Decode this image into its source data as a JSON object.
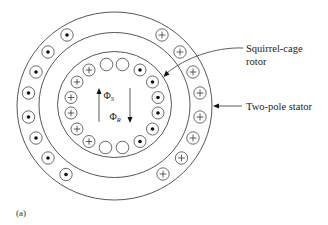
{
  "diagram": {
    "type": "induction-motor-cross-section",
    "caption": "(a)",
    "labels": {
      "rotor": [
        "Squirrel-cage",
        "rotor"
      ],
      "stator": "Two-pole stator"
    },
    "flux": {
      "stator": {
        "symbol": "Φ",
        "subscript": "S",
        "direction": "up"
      },
      "rotor": {
        "symbol": "Φ",
        "subscript": "R",
        "direction": "down"
      }
    },
    "stator_conductors": {
      "left_side": "dot",
      "right_side": "plus",
      "count_per_side": 8
    },
    "rotor_conductors": {
      "left_side": "plus",
      "right_side": "dot",
      "count_per_side": 6,
      "top_empty": 2,
      "bottom_empty": 2
    },
    "colors": {
      "stroke": "#444444",
      "background": "#ffffff"
    }
  }
}
